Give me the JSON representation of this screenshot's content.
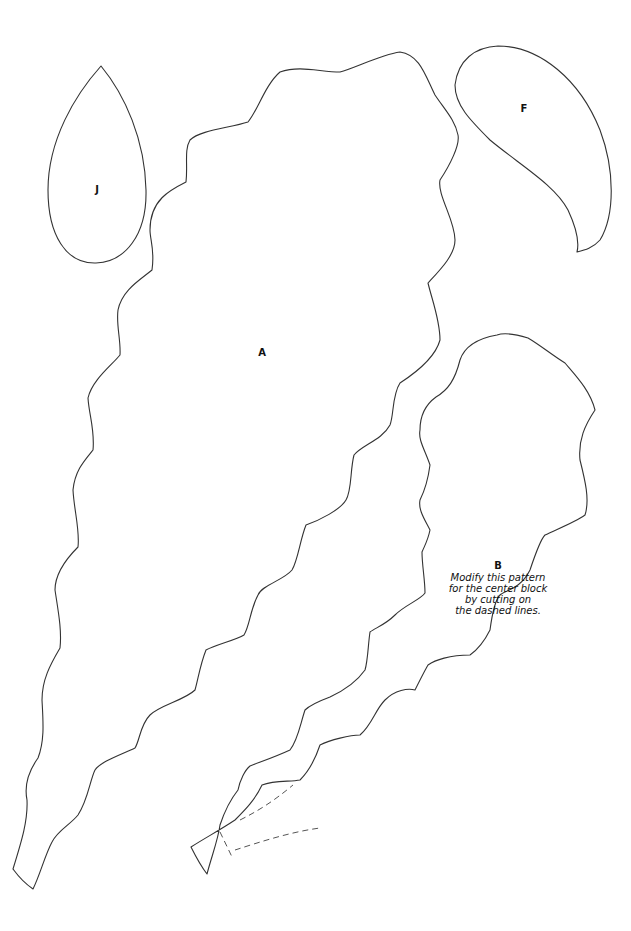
{
  "pieces": [
    {
      "id": "A",
      "label": "A"
    },
    {
      "id": "B",
      "label": "B",
      "note_lines": [
        "Modify this pattern",
        "for the center block",
        "by cutting on",
        "the dashed lines."
      ]
    },
    {
      "id": "F",
      "label": "F"
    },
    {
      "id": "J",
      "label": "J"
    }
  ],
  "colors": {
    "stroke": "#333333",
    "background": "#ffffff"
  }
}
